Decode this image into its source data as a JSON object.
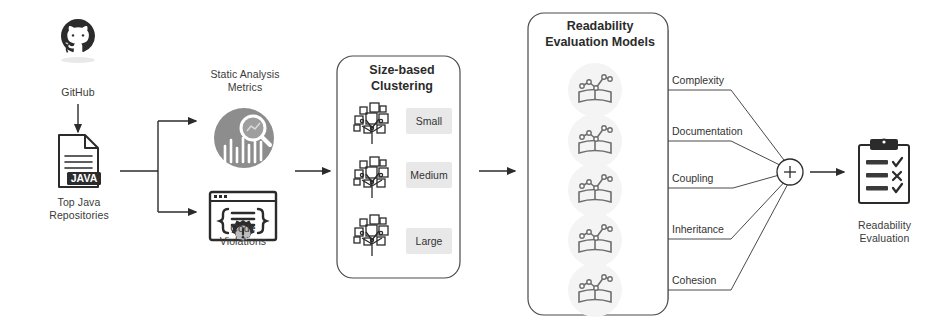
{
  "diagram": {
    "colors": {
      "stroke": "#2b2b2b",
      "line": "#4a4a4a",
      "chip_bg": "#e8e8e8",
      "metrics_circle": "#8a8a8a",
      "model_circle": "#f2f2f2",
      "background": "#ffffff"
    },
    "source": {
      "github_label": "GitHub",
      "github_icon": "github-octocat-icon",
      "repos_label": "Top Java\nRepositories",
      "repos_icon": "java-file-icon",
      "java_badge": "JAVA"
    },
    "analysis": {
      "metrics_label": "Static Analysis\nMetrics",
      "metrics_icon": "analytics-magnifier-icon",
      "violations_label": "Code\nViolations",
      "violations_icon": "code-window-gear-icon"
    },
    "clustering": {
      "title": "Size-based\nClustering",
      "cluster_icon": "hierarchy-tree-icon",
      "buckets": [
        {
          "label": "Small"
        },
        {
          "label": "Medium"
        },
        {
          "label": "Large"
        }
      ]
    },
    "models": {
      "title": "Readability\nEvaluation Models",
      "model_icon": "book-chart-icon",
      "items": [
        {
          "label": "Complexity"
        },
        {
          "label": "Documentation"
        },
        {
          "label": "Coupling"
        },
        {
          "label": "Inheritance"
        },
        {
          "label": "Cohesion"
        }
      ]
    },
    "aggregator": {
      "symbol": "+",
      "name": "sum-node"
    },
    "output": {
      "label": "Readability\nEvaluation",
      "icon": "clipboard-checklist-icon",
      "marks": [
        "check",
        "cross",
        "check"
      ]
    }
  }
}
